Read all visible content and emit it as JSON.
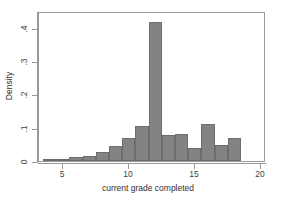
{
  "chart_data": {
    "type": "bar",
    "title": "",
    "subtitle": "",
    "xlabel": "current grade completed",
    "ylabel": "Density",
    "xlim": [
      3.2,
      20.4
    ],
    "ylim": [
      0,
      0.45
    ],
    "grid": false,
    "legend": null,
    "bar_fill_color": "#838383",
    "bar_edge_color": "#6d6d6d",
    "frame_color": "#9a9a9a",
    "background_color": "#ffffff",
    "bin_width": 1,
    "xticks": [
      {
        "value": 5,
        "label": "5"
      },
      {
        "value": 10,
        "label": "10"
      },
      {
        "value": 15,
        "label": "15"
      },
      {
        "value": 20,
        "label": "20"
      }
    ],
    "yticks": [
      {
        "value": 0,
        "label": "0"
      },
      {
        "value": 0.1,
        "label": ".1"
      },
      {
        "value": 0.2,
        "label": ".2"
      },
      {
        "value": 0.3,
        "label": ".3"
      },
      {
        "value": 0.4,
        "label": ".4"
      }
    ],
    "bins": [
      {
        "x0": 3.5,
        "x1": 4.5,
        "center": 4,
        "density": 0.004
      },
      {
        "x0": 4.5,
        "x1": 5.5,
        "center": 5,
        "density": 0.004
      },
      {
        "x0": 5.5,
        "x1": 6.5,
        "center": 6,
        "density": 0.012
      },
      {
        "x0": 6.5,
        "x1": 7.5,
        "center": 7,
        "density": 0.014
      },
      {
        "x0": 7.5,
        "x1": 8.5,
        "center": 8,
        "density": 0.028
      },
      {
        "x0": 8.5,
        "x1": 9.5,
        "center": 9,
        "density": 0.044
      },
      {
        "x0": 9.5,
        "x1": 10.5,
        "center": 10,
        "density": 0.068
      },
      {
        "x0": 10.5,
        "x1": 11.5,
        "center": 11,
        "density": 0.106
      },
      {
        "x0": 11.5,
        "x1": 12.5,
        "center": 12,
        "density": 0.418
      },
      {
        "x0": 12.5,
        "x1": 13.5,
        "center": 13,
        "density": 0.078
      },
      {
        "x0": 13.5,
        "x1": 14.5,
        "center": 14,
        "density": 0.082
      },
      {
        "x0": 14.5,
        "x1": 15.5,
        "center": 15,
        "density": 0.04
      },
      {
        "x0": 15.5,
        "x1": 16.5,
        "center": 16,
        "density": 0.111
      },
      {
        "x0": 16.5,
        "x1": 17.5,
        "center": 17,
        "density": 0.047
      },
      {
        "x0": 17.5,
        "x1": 18.5,
        "center": 18,
        "density": 0.068
      }
    ],
    "categories": [
      4,
      5,
      6,
      7,
      8,
      9,
      10,
      11,
      12,
      13,
      14,
      15,
      16,
      17,
      18
    ],
    "values": [
      0.004,
      0.004,
      0.012,
      0.014,
      0.028,
      0.044,
      0.068,
      0.106,
      0.418,
      0.078,
      0.082,
      0.04,
      0.111,
      0.047,
      0.068
    ]
  }
}
